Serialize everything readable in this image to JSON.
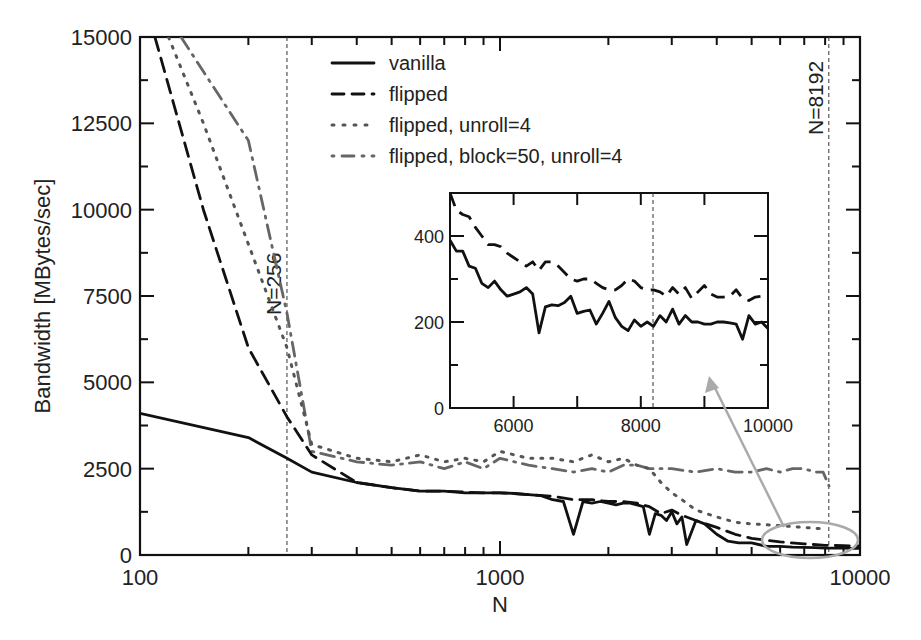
{
  "chart_data": {
    "type": "line",
    "title": "",
    "xlabel": "N",
    "ylabel": "Bandwidth [MBytes/sec]",
    "xscale": "log",
    "xlim": [
      100,
      10000
    ],
    "ylim": [
      0,
      15000
    ],
    "x_ticks": [
      "100",
      "1000",
      "10000"
    ],
    "y_ticks": [
      "0",
      "2500",
      "5000",
      "7500",
      "10000",
      "12500",
      "15000"
    ],
    "grid": false,
    "legend": {
      "position": "upper center",
      "entries": [
        "vanilla",
        "flipped",
        "flipped, unroll=4",
        "flipped, block=50, unroll=4"
      ]
    },
    "annotations": [
      {
        "text": "N=256",
        "x": 256,
        "type": "vertical-dashed-line"
      },
      {
        "text": "N=8192",
        "x": 8192,
        "type": "vertical-dashed-line"
      }
    ],
    "series": [
      {
        "name": "vanilla",
        "style": "solid",
        "color": "#111111",
        "x": [
          100,
          200,
          256,
          300,
          400,
          500,
          600,
          700,
          800,
          900,
          1000,
          1100,
          1200,
          1300,
          1400,
          1500,
          1600,
          1700,
          1800,
          1900,
          2000,
          2100,
          2200,
          2300,
          2400,
          2500,
          2600,
          2700,
          2800,
          2900,
          3000,
          3100,
          3200,
          3300,
          3500,
          3700,
          4000,
          4300,
          4600,
          5000,
          5500,
          6000,
          6500,
          7000,
          7500,
          8000,
          8500,
          9000,
          9500,
          10000
        ],
        "y": [
          4100,
          3400,
          2800,
          2400,
          2100,
          1950,
          1850,
          1850,
          1800,
          1800,
          1800,
          1780,
          1750,
          1720,
          1600,
          1550,
          600,
          1550,
          1500,
          1550,
          1500,
          1450,
          1500,
          1500,
          1450,
          1400,
          600,
          1200,
          1150,
          1000,
          1250,
          900,
          1100,
          300,
          1000,
          900,
          600,
          400,
          350,
          350,
          250,
          250,
          230,
          220,
          210,
          200,
          200,
          200,
          190,
          190
        ]
      },
      {
        "name": "flipped",
        "style": "dashed",
        "color": "#111111",
        "x": [
          110,
          150,
          200,
          256,
          300,
          400,
          500,
          600,
          700,
          800,
          900,
          1000,
          1200,
          1400,
          1600,
          1800,
          2000,
          2200,
          2400,
          2600,
          2800,
          3000,
          3200,
          3500,
          4000,
          4500,
          5000,
          6000,
          7000,
          8000,
          9000,
          10000
        ],
        "y": [
          15000,
          10000,
          6000,
          4000,
          2900,
          2100,
          1950,
          1850,
          1850,
          1820,
          1800,
          1800,
          1750,
          1700,
          1600,
          1600,
          1550,
          1550,
          1500,
          1400,
          1200,
          1300,
          1150,
          1000,
          800,
          600,
          480,
          380,
          320,
          280,
          270,
          260
        ]
      },
      {
        "name": "flipped, unroll=4",
        "style": "dotted",
        "color": "#555555",
        "x": [
          120,
          150,
          200,
          256,
          300,
          400,
          500,
          600,
          700,
          800,
          900,
          1000,
          1200,
          1400,
          1600,
          1800,
          2000,
          2200,
          2400,
          2600,
          2800,
          3000,
          3200,
          3500,
          4000,
          4500,
          5000,
          6000,
          7000,
          8000
        ],
        "y": [
          15000,
          12500,
          9000,
          6000,
          3200,
          2800,
          2700,
          2900,
          2700,
          2800,
          2700,
          3000,
          2800,
          2800,
          2700,
          2900,
          2700,
          2800,
          2600,
          2500,
          2100,
          1800,
          1600,
          1300,
          1100,
          950,
          900,
          850,
          800,
          750
        ]
      },
      {
        "name": "flipped, block=50, unroll=4",
        "style": "dash-dot",
        "color": "#666666",
        "x": [
          130,
          150,
          200,
          256,
          300,
          400,
          500,
          600,
          700,
          800,
          900,
          1000,
          1200,
          1400,
          1600,
          1800,
          2000,
          2200,
          2400,
          2600,
          2800,
          3000,
          3500,
          4000,
          4500,
          5000,
          5500,
          6000,
          6500,
          7000,
          7500,
          7900,
          8200
        ],
        "y": [
          15000,
          14000,
          12000,
          7000,
          3000,
          2700,
          2600,
          2700,
          2500,
          2700,
          2500,
          2800,
          2600,
          2500,
          2400,
          2500,
          2400,
          2600,
          2600,
          2500,
          2500,
          2500,
          2400,
          2500,
          2400,
          2400,
          2500,
          2400,
          2500,
          2500,
          2400,
          2400,
          2000
        ]
      }
    ],
    "inset": {
      "xlim": [
        5000,
        10000
      ],
      "ylim": [
        0,
        500
      ],
      "x_ticks": [
        "6000",
        "8000",
        "10000"
      ],
      "y_ticks": [
        "0",
        "200",
        "400"
      ],
      "vline_x": 8192,
      "series": [
        {
          "name": "vanilla",
          "style": "solid",
          "x": [
            5000,
            5100,
            5200,
            5300,
            5400,
            5500,
            5600,
            5700,
            5800,
            5900,
            6000,
            6100,
            6200,
            6300,
            6400,
            6500,
            6600,
            6700,
            6800,
            6900,
            7000,
            7100,
            7200,
            7300,
            7400,
            7500,
            7600,
            7700,
            7800,
            7900,
            8000,
            8100,
            8200,
            8300,
            8400,
            8500,
            8600,
            8700,
            8800,
            8900,
            9000,
            9100,
            9200,
            9300,
            9400,
            9500,
            9600,
            9700,
            9800,
            9900,
            10000
          ],
          "y": [
            390,
            365,
            365,
            330,
            325,
            290,
            280,
            295,
            275,
            260,
            265,
            270,
            280,
            265,
            175,
            235,
            240,
            238,
            245,
            260,
            220,
            225,
            228,
            195,
            220,
            248,
            210,
            190,
            180,
            205,
            190,
            200,
            190,
            215,
            200,
            230,
            195,
            215,
            200,
            200,
            195,
            195,
            200,
            200,
            198,
            195,
            160,
            215,
            195,
            200,
            185
          ]
        },
        {
          "name": "flipped",
          "style": "dashed",
          "x": [
            5000,
            5100,
            5200,
            5300,
            5400,
            5500,
            5600,
            5700,
            5800,
            5900,
            6000,
            6100,
            6200,
            6300,
            6400,
            6500,
            6600,
            6700,
            6800,
            6900,
            7000,
            7100,
            7200,
            7300,
            7400,
            7500,
            7600,
            7700,
            7800,
            7900,
            8000,
            8100,
            8200,
            8300,
            8400,
            8500,
            8600,
            8700,
            8800,
            8900,
            9000,
            9100,
            9200,
            9300,
            9400,
            9500,
            9600,
            9700,
            9800,
            9900,
            10000
          ],
          "y": [
            500,
            460,
            450,
            445,
            420,
            400,
            380,
            380,
            375,
            360,
            350,
            340,
            330,
            340,
            320,
            340,
            340,
            330,
            315,
            300,
            295,
            300,
            300,
            290,
            280,
            275,
            275,
            285,
            300,
            295,
            280,
            275,
            275,
            270,
            260,
            280,
            265,
            280,
            255,
            270,
            285,
            265,
            258,
            258,
            260,
            275,
            255,
            250,
            258,
            260,
            258
          ]
        }
      ]
    },
    "callout": {
      "ellipse_center": [
        7600,
        180
      ],
      "arrow_to_inset_x": 9100,
      "color": "#aaaaaa"
    }
  }
}
